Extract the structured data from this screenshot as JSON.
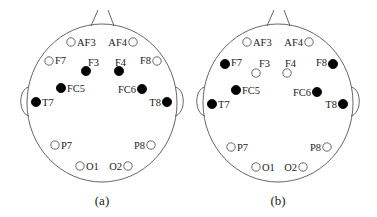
{
  "colors": {
    "active": "#000000",
    "inactive_fill": "#ffffff",
    "inactive_stroke": "#444444",
    "outline": "#555555"
  },
  "panels": [
    {
      "caption": "(a)",
      "offset_x": 0,
      "electrodes": [
        {
          "name": "AF3",
          "x": 71,
          "y": 42,
          "active": false,
          "lx": 77,
          "ly": 46,
          "anchor": "start"
        },
        {
          "name": "AF4",
          "x": 133,
          "y": 42,
          "active": false,
          "lx": 127,
          "ly": 46,
          "anchor": "end"
        },
        {
          "name": "F7",
          "x": 49,
          "y": 61,
          "active": false,
          "lx": 55,
          "ly": 64,
          "anchor": "start"
        },
        {
          "name": "F3",
          "x": 86,
          "y": 71,
          "active": true,
          "lx": 88,
          "ly": 66,
          "anchor": "start"
        },
        {
          "name": "F4",
          "x": 119,
          "y": 71,
          "active": true,
          "lx": 115,
          "ly": 66,
          "anchor": "start"
        },
        {
          "name": "F8",
          "x": 157,
          "y": 61,
          "active": false,
          "lx": 151,
          "ly": 64,
          "anchor": "end"
        },
        {
          "name": "FC5",
          "x": 61,
          "y": 88,
          "active": true,
          "lx": 67,
          "ly": 92,
          "anchor": "start"
        },
        {
          "name": "FC6",
          "x": 142,
          "y": 89,
          "active": true,
          "lx": 136,
          "ly": 93,
          "anchor": "end"
        },
        {
          "name": "T7",
          "x": 36,
          "y": 102,
          "active": true,
          "lx": 42,
          "ly": 106,
          "anchor": "start"
        },
        {
          "name": "T8",
          "x": 167,
          "y": 102,
          "active": true,
          "lx": 161,
          "ly": 106,
          "anchor": "end"
        },
        {
          "name": "P7",
          "x": 55,
          "y": 145,
          "active": false,
          "lx": 61,
          "ly": 149,
          "anchor": "start"
        },
        {
          "name": "P8",
          "x": 151,
          "y": 145,
          "active": false,
          "lx": 145,
          "ly": 149,
          "anchor": "end"
        },
        {
          "name": "O1",
          "x": 80,
          "y": 166,
          "active": false,
          "lx": 86,
          "ly": 170,
          "anchor": "start"
        },
        {
          "name": "O2",
          "x": 128,
          "y": 166,
          "active": false,
          "lx": 122,
          "ly": 170,
          "anchor": "end"
        }
      ]
    },
    {
      "caption": "(b)",
      "offset_x": 176,
      "electrodes": [
        {
          "name": "AF3",
          "x": 71,
          "y": 42,
          "active": false,
          "lx": 77,
          "ly": 46,
          "anchor": "start"
        },
        {
          "name": "AF4",
          "x": 133,
          "y": 42,
          "active": false,
          "lx": 127,
          "ly": 46,
          "anchor": "end"
        },
        {
          "name": "F7",
          "x": 49,
          "y": 64,
          "active": true,
          "lx": 55,
          "ly": 66,
          "anchor": "start"
        },
        {
          "name": "F3",
          "x": 80,
          "y": 73,
          "active": false,
          "lx": 83,
          "ly": 67,
          "anchor": "start"
        },
        {
          "name": "F4",
          "x": 111,
          "y": 73,
          "active": false,
          "lx": 109,
          "ly": 67,
          "anchor": "start"
        },
        {
          "name": "F8",
          "x": 157,
          "y": 64,
          "active": true,
          "lx": 151,
          "ly": 66,
          "anchor": "end"
        },
        {
          "name": "FC5",
          "x": 60,
          "y": 90,
          "active": true,
          "lx": 66,
          "ly": 94,
          "anchor": "start"
        },
        {
          "name": "FC6",
          "x": 141,
          "y": 92,
          "active": true,
          "lx": 135,
          "ly": 96,
          "anchor": "end"
        },
        {
          "name": "T7",
          "x": 36,
          "y": 104,
          "active": true,
          "lx": 42,
          "ly": 108,
          "anchor": "start"
        },
        {
          "name": "T8",
          "x": 167,
          "y": 104,
          "active": true,
          "lx": 161,
          "ly": 108,
          "anchor": "end"
        },
        {
          "name": "P7",
          "x": 55,
          "y": 147,
          "active": false,
          "lx": 61,
          "ly": 151,
          "anchor": "start"
        },
        {
          "name": "P8",
          "x": 151,
          "y": 147,
          "active": false,
          "lx": 145,
          "ly": 151,
          "anchor": "end"
        },
        {
          "name": "O1",
          "x": 80,
          "y": 167,
          "active": false,
          "lx": 86,
          "ly": 171,
          "anchor": "start"
        },
        {
          "name": "O2",
          "x": 127,
          "y": 167,
          "active": false,
          "lx": 121,
          "ly": 171,
          "anchor": "end"
        }
      ]
    }
  ]
}
